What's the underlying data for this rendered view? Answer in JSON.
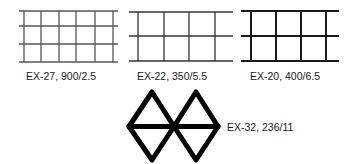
{
  "figure": {
    "patterns": [
      {
        "id": "ex27",
        "label": "EX-27, 900/2.5",
        "shape": "rectangular-grid",
        "stroke_color": "#555555"
      },
      {
        "id": "ex22",
        "label": "EX-22, 350/5.5",
        "shape": "rectangular-grid",
        "stroke_color": "#333333"
      },
      {
        "id": "ex20",
        "label": "EX-20, 400/6.5",
        "shape": "rectangular-grid",
        "stroke_color": "#1a1a1a"
      },
      {
        "id": "ex32",
        "label": "EX-32, 236/11",
        "shape": "double-diamond",
        "stroke_color": "#000000"
      }
    ]
  }
}
